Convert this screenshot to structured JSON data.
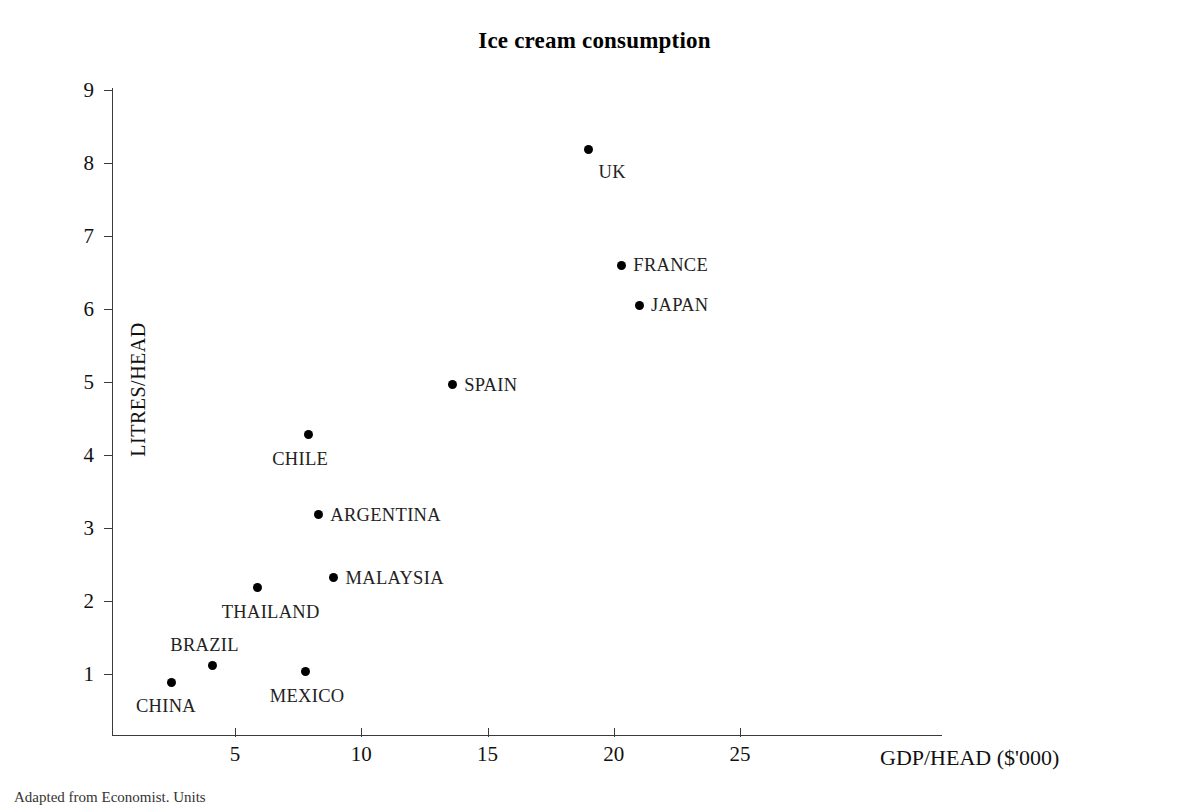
{
  "chart_data": {
    "type": "scatter",
    "title": "Ice cream consumption",
    "xlabel": "GDP/HEAD ($'000)",
    "ylabel": "LITRES/HEAD",
    "xlim": [
      0,
      32.8
    ],
    "ylim": [
      0,
      9.8
    ],
    "xticks": [
      5,
      10,
      15,
      20,
      25
    ],
    "yticks": [
      1,
      2,
      3,
      4,
      5,
      6,
      7,
      8,
      9
    ],
    "grid": false,
    "legend": "none",
    "marker": "filled-circle",
    "marker_color": "#000000",
    "points": [
      {
        "label": "UK",
        "x": 19.0,
        "y": 8.18,
        "label_pos": "below-right"
      },
      {
        "label": "FRANCE",
        "x": 20.3,
        "y": 6.6,
        "label_pos": "right"
      },
      {
        "label": "JAPAN",
        "x": 21.0,
        "y": 6.05,
        "label_pos": "right"
      },
      {
        "label": "SPAIN",
        "x": 13.6,
        "y": 4.96,
        "label_pos": "right"
      },
      {
        "label": "CHILE",
        "x": 7.9,
        "y": 4.28,
        "label_pos": "below-left"
      },
      {
        "label": "ARGENTINA",
        "x": 8.3,
        "y": 3.18,
        "label_pos": "right"
      },
      {
        "label": "MALAYSIA",
        "x": 8.9,
        "y": 2.32,
        "label_pos": "right"
      },
      {
        "label": "THAILAND",
        "x": 5.9,
        "y": 2.18,
        "label_pos": "below-left"
      },
      {
        "label": "BRAZIL",
        "x": 4.1,
        "y": 1.12,
        "label_pos": "above-left"
      },
      {
        "label": "MEXICO",
        "x": 7.8,
        "y": 1.03,
        "label_pos": "below-left"
      },
      {
        "label": "CHINA",
        "x": 2.5,
        "y": 0.89,
        "label_pos": "below-left"
      }
    ]
  },
  "caption": "Adapted from Economist. Units"
}
